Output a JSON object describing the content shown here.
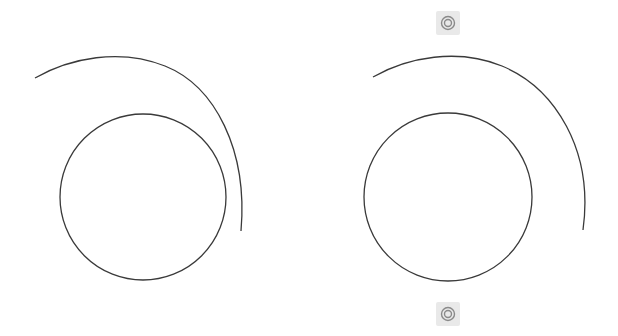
{
  "colors": {
    "background": "#ffffff",
    "stroke": "#3a3a3a",
    "grip_bg": "#e9e9e9",
    "grip_ring": "#8a8a8a"
  },
  "figures": [
    {
      "id": "left",
      "inner_circle": {
        "cx": 143,
        "cy": 197,
        "r": 83
      },
      "outer_arc": {
        "path": "M35 78 C 70 58, 120 48, 165 66 C 215 86, 248 150, 241 231"
      }
    },
    {
      "id": "right",
      "inner_circle": {
        "cx": 448,
        "cy": 197,
        "r": 84
      },
      "outer_arc": {
        "path": "M373 77 C 408 57, 458 48, 502 66 C 555 88, 594 150, 583 230"
      }
    }
  ],
  "grips": [
    {
      "id": "top",
      "cx": 448,
      "cy": 23
    },
    {
      "id": "bottom",
      "cx": 448,
      "cy": 314
    }
  ]
}
